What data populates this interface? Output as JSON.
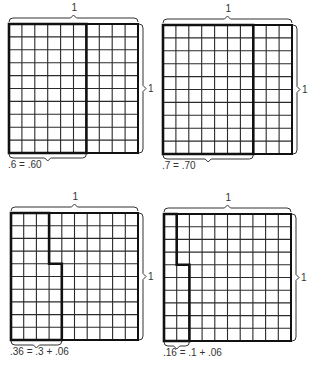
{
  "figures": [
    {
      "id": "fig-060",
      "grid": {
        "x": 9,
        "y": 24,
        "size": 129,
        "rows": 10,
        "cols": 10
      },
      "top_label": "1",
      "side_label": "1",
      "caption": ".6 = .60",
      "highlight": {
        "full_cols": 6,
        "extra_cells": 0
      },
      "bottom_brace_cols": 6
    },
    {
      "id": "fig-070",
      "grid": {
        "x": 163,
        "y": 25,
        "size": 129,
        "rows": 10,
        "cols": 10
      },
      "top_label": "1",
      "side_label": "1",
      "caption": ".7 = .70",
      "highlight": {
        "full_cols": 7,
        "extra_cells": 0
      },
      "bottom_brace_cols": 7
    },
    {
      "id": "fig-036",
      "grid": {
        "x": 11,
        "y": 213,
        "size": 127,
        "rows": 10,
        "cols": 10
      },
      "top_label": "1",
      "side_label": "1",
      "caption": ".36 = .3 + .06",
      "highlight": {
        "full_cols": 3,
        "extra_cells": 6
      },
      "bottom_brace_cols": 4
    },
    {
      "id": "fig-016",
      "grid": {
        "x": 164,
        "y": 214,
        "size": 127,
        "rows": 10,
        "cols": 10
      },
      "top_label": "1",
      "side_label": "1",
      "caption": ".16 = .1 + .06",
      "highlight": {
        "full_cols": 1,
        "extra_cells": 6
      },
      "bottom_brace_cols": 2
    }
  ],
  "colors": {
    "grid": "#2a2a2a",
    "outline": "#111111",
    "brace": "#333333"
  }
}
